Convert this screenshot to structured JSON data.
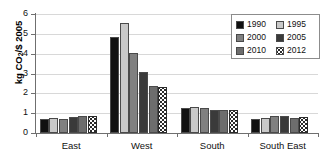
{
  "chart_data": {
    "type": "bar",
    "title": "",
    "xlabel": "",
    "ylabel": "kg CO2/$ 2005",
    "ylabel_prefix": "kg CO",
    "ylabel_sub": "2",
    "ylabel_suffix": "/$ 2005",
    "ylim": [
      0,
      6
    ],
    "yticks": [
      0,
      1,
      2,
      3,
      4,
      5,
      6
    ],
    "ytick_labels": [
      "0",
      "1",
      "2",
      "3",
      "4",
      "5",
      "6"
    ],
    "grid": true,
    "legend_position": "top-right",
    "categories": [
      "East",
      "West",
      "South",
      "South East"
    ],
    "series": [
      {
        "name": "1990",
        "color": "#111111",
        "pattern": "solid",
        "values": [
          0.7,
          4.82,
          1.28,
          0.7
        ]
      },
      {
        "name": "1995",
        "color": "#c9c9c9",
        "pattern": "solid",
        "values": [
          0.74,
          5.55,
          1.33,
          0.76
        ]
      },
      {
        "name": "2000",
        "color": "#808080",
        "pattern": "solid",
        "values": [
          0.69,
          4.05,
          1.28,
          0.84
        ]
      },
      {
        "name": "2005",
        "color": "#3a3a3a",
        "pattern": "solid",
        "values": [
          0.83,
          3.08,
          1.15,
          0.84
        ]
      },
      {
        "name": "2010",
        "color": "#6d6d6d",
        "pattern": "solid",
        "values": [
          0.84,
          2.38,
          1.15,
          0.78
        ]
      },
      {
        "name": "2012",
        "color": "#ffffff",
        "pattern": "dotted",
        "values": [
          0.88,
          2.33,
          1.16,
          0.8
        ]
      }
    ]
  },
  "legend": {
    "rows": [
      [
        {
          "label": "1990"
        },
        {
          "label": "1995"
        }
      ],
      [
        {
          "label": "2000"
        },
        {
          "label": "2005"
        }
      ],
      [
        {
          "label": "2010"
        },
        {
          "label": "2012"
        }
      ]
    ]
  }
}
